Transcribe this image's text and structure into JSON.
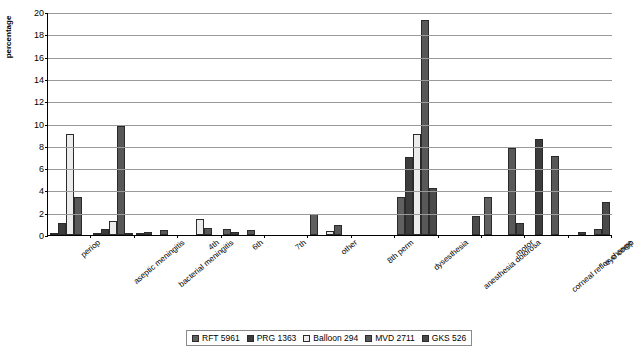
{
  "chart_data": {
    "type": "bar",
    "title": "",
    "xlabel": "",
    "ylabel": "percentage",
    "ylim": [
      0,
      20
    ],
    "ytick_step": 2,
    "yticks": [
      "0",
      "2",
      "4",
      "6",
      "8",
      "10",
      "12",
      "14",
      "16",
      "18",
      "20"
    ],
    "grid": true,
    "legend_position": "bottom",
    "categories": [
      "periop",
      "aseptic meningitis",
      "bacterial meningitis",
      "4th",
      "6th",
      "7th",
      "other",
      "8th perm",
      "dysesthesia",
      "anesthesia dolorosa",
      "motor",
      "corneal reflex change",
      "eye comp"
    ],
    "series": [
      {
        "name": "RFT 5961",
        "color": "#606060",
        "values": [
          0.15,
          0.15,
          0.15,
          0.0,
          0.5,
          0.0,
          1.9,
          0.0,
          3.4,
          0.0,
          3.4,
          0.0,
          0.0
        ]
      },
      {
        "name": "PRG 1363",
        "color": "#3c3c3c",
        "values": [
          1.1,
          0.5,
          0.3,
          0.0,
          0.3,
          0.0,
          0.0,
          0.0,
          7.0,
          0.0,
          0.0,
          8.6,
          0.3
        ]
      },
      {
        "name": "Balloon 294",
        "color": "#ececec",
        "values": [
          9.1,
          1.3,
          0.0,
          1.4,
          0.0,
          0.0,
          0.4,
          0.0,
          9.1,
          0.0,
          0.0,
          0.0,
          0.0
        ]
      },
      {
        "name": "MVD 2711",
        "color": "#585858",
        "values": [
          3.4,
          9.8,
          0.45,
          0.6,
          0.45,
          0.0,
          0.9,
          0.0,
          19.3,
          0.0,
          7.8,
          7.1,
          0.55
        ]
      },
      {
        "name": "GKS 526",
        "color": "#4a4a4a",
        "values": [
          0.0,
          0.15,
          0.0,
          0.0,
          0.0,
          0.0,
          0.0,
          0.0,
          4.2,
          1.7,
          1.1,
          0.0,
          3.0
        ]
      }
    ]
  },
  "legend": {
    "items": [
      {
        "label": "RFT 5961"
      },
      {
        "label": "PRG 1363"
      },
      {
        "label": "Balloon 294"
      },
      {
        "label": "MVD 2711"
      },
      {
        "label": "GKS 526"
      }
    ]
  },
  "caption": {
    "text": ""
  }
}
